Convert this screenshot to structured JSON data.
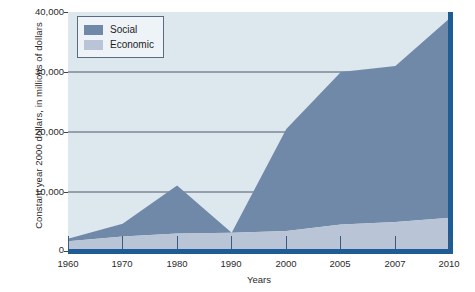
{
  "chart_data": {
    "type": "area",
    "stacked": true,
    "title": "",
    "xlabel": "Years",
    "ylabel": "Constant year 2000 dollars, in millions of dollars",
    "categories": [
      "1960",
      "1970",
      "1980",
      "1990",
      "2000",
      "2005",
      "2007",
      "2010"
    ],
    "x_tick_labels": [
      "1960",
      "1970",
      "1980",
      "1990",
      "2000",
      "2005",
      "2007",
      "2010"
    ],
    "y_tick_labels": [
      "0",
      "10,000",
      "20,000",
      "30,000",
      "40,000"
    ],
    "y_tick_values": [
      0,
      10000,
      20000,
      30000,
      40000
    ],
    "ylim": [
      0,
      40000
    ],
    "grid": "horizontal",
    "legend_position": "top-left",
    "series": [
      {
        "name": "Economic",
        "color": "#b9c5d6",
        "values": [
          1800,
          2600,
          3100,
          3200,
          3500,
          4600,
          5000,
          5700
        ]
      },
      {
        "name": "Social",
        "color": "#7089a8",
        "values": [
          400,
          2100,
          8000,
          0,
          17000,
          25400,
          26000,
          33300
        ]
      }
    ],
    "totals": [
      2200,
      4700,
      11100,
      3200,
      20500,
      30000,
      31000,
      39000
    ],
    "colors": {
      "plot_background": "#dde7ee",
      "axis_rule": "#1f5c96",
      "gridline": "#4a5a6a",
      "legend_background": "#eef3f7",
      "legend_border": "#5a6b80",
      "text": "#2b2b2b"
    }
  },
  "axes": {
    "y_title": "Constant year 2000 dollars, in millions of dollars",
    "x_title": "Years"
  },
  "legend": {
    "items": [
      {
        "label": "Social"
      },
      {
        "label": "Economic"
      }
    ]
  }
}
